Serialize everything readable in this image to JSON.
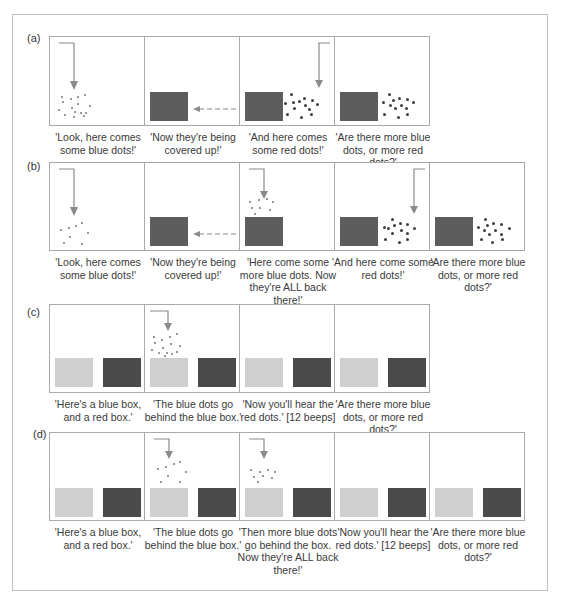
{
  "figure": {
    "rows": [
      {
        "label": "(a)",
        "panels": [
          {
            "caption": "'Look, here comes some blue dots!'"
          },
          {
            "caption": "'Now they're being covered up!'"
          },
          {
            "caption": "'And here comes some red dots!'"
          },
          {
            "caption": "'Are there more blue dots, or more red dots?'"
          }
        ]
      },
      {
        "label": "(b)",
        "panels": [
          {
            "caption": "'Look, here comes some blue dots!'"
          },
          {
            "caption": "'Now they're being covered up!'"
          },
          {
            "caption": "'Here come some more blue dots. Now they're ALL back there!'"
          },
          {
            "caption": "'And here come some red dots!'"
          },
          {
            "caption": "'Are there more blue dots, or more red dots?'"
          }
        ]
      },
      {
        "label": "(c)",
        "panels": [
          {
            "caption": "'Here's a blue box, and a red box.'"
          },
          {
            "caption": "'The blue dots go behind the blue box.'"
          },
          {
            "caption": "'Now you'll hear the red dots.' [12 beeps]"
          },
          {
            "caption": "'Are there more blue dots, or more red dots?'"
          }
        ]
      },
      {
        "label": "(d)",
        "panels": [
          {
            "caption": "'Here's a blue box, and a red box.'"
          },
          {
            "caption": "'The blue dots go behind the blue box.'"
          },
          {
            "caption": "'Then more blue dots go behind the box. Now they're ALL back there!'"
          },
          {
            "caption": "'Now you'll hear the red dots.' [12 beeps]"
          },
          {
            "caption": "'Are there more blue dots, or more red dots?'"
          }
        ]
      }
    ],
    "colors": {
      "frame_border": "#bdbdbd",
      "panel_border": "#a9a9a9",
      "occluder_dark": "#5d5d5d",
      "blue_box": "#cfcfcf",
      "red_box": "#4a4a4a",
      "arrow": "#8a8a8a",
      "text": "#3a3a3a"
    }
  }
}
